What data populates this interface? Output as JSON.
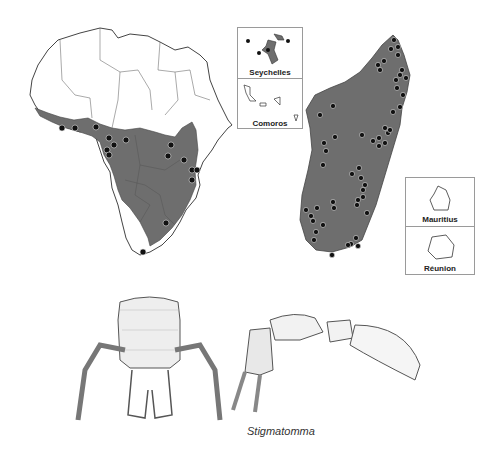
{
  "figure": {
    "genus_caption": "Stigmatomma",
    "colors": {
      "distribution_fill": "#6e6e6e",
      "record_dot": "#111111",
      "outline": "#444444",
      "background": "#ffffff"
    }
  },
  "maps": {
    "africa": {
      "label": "Africa mainland distribution map",
      "record_count_visible": 20
    },
    "madagascar": {
      "label": "Madagascar distribution map",
      "record_count_visible": 60
    },
    "insets": [
      {
        "name": "Seychelles",
        "has_records": true
      },
      {
        "name": "Comoros",
        "has_records": false
      },
      {
        "name": "Mauritius",
        "has_records": false
      },
      {
        "name": "Réunion",
        "has_records": false
      }
    ]
  },
  "illustrations": [
    {
      "view": "head full-face view"
    },
    {
      "view": "body lateral view"
    }
  ]
}
